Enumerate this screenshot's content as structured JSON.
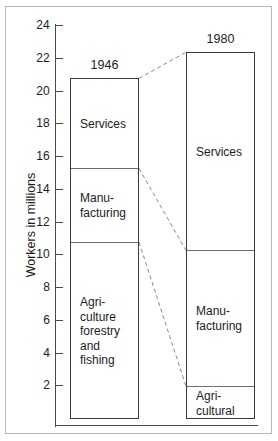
{
  "chart_data": {
    "type": "bar",
    "subtype": "stacked-column-comparison",
    "title": "",
    "xlabel": "",
    "ylabel": "Workers in millions",
    "ylim": [
      0,
      25
    ],
    "yticks": [
      2,
      4,
      6,
      8,
      10,
      12,
      14,
      16,
      18,
      20,
      22,
      24
    ],
    "grid": false,
    "legend": "none (segments labelled in place)",
    "units": "millions of workers",
    "categories": [
      "1946",
      "1980"
    ],
    "series": [
      {
        "name": "Agriculture forestry and fishing",
        "values": [
          10.8,
          2.0
        ]
      },
      {
        "name": "Manufacturing",
        "values": [
          4.5,
          8.3
        ]
      },
      {
        "name": "Services",
        "values": [
          5.5,
          12.1
        ]
      }
    ],
    "totals": [
      20.8,
      22.4
    ],
    "annotations": [
      "Dashed connector lines join the matching segment boundaries of the 1946 and 1980 columns."
    ]
  },
  "axis": {
    "title": "Workers in millions",
    "ticks": [
      {
        "value": 24,
        "label": "24"
      },
      {
        "value": 22,
        "label": "22"
      },
      {
        "value": 20,
        "label": "20"
      },
      {
        "value": 18,
        "label": "18"
      },
      {
        "value": 16,
        "label": "16"
      },
      {
        "value": 14,
        "label": "14"
      },
      {
        "value": 12,
        "label": "12"
      },
      {
        "value": 10,
        "label": "10"
      },
      {
        "value": 8,
        "label": "8"
      },
      {
        "value": 6,
        "label": "6"
      },
      {
        "value": 4,
        "label": "4"
      },
      {
        "value": 2,
        "label": "2"
      }
    ]
  },
  "bars": [
    {
      "key": "bar-1946",
      "title": "1946",
      "total": 20.8,
      "segments": [
        {
          "key": "services",
          "label": "Services",
          "bottom": 15.3,
          "top": 20.8,
          "value": 5.5
        },
        {
          "key": "manufacturing",
          "label": "Manu-\nfacturing",
          "bottom": 10.8,
          "top": 15.3,
          "value": 4.5
        },
        {
          "key": "agriculture",
          "label": "Agri-\nculture\nforestry\nand\nfishing",
          "bottom": 0,
          "top": 10.8,
          "value": 10.8
        }
      ]
    },
    {
      "key": "bar-1980",
      "title": "1980",
      "total": 22.4,
      "segments": [
        {
          "key": "services",
          "label": "Services",
          "bottom": 10.3,
          "top": 22.4,
          "value": 12.1
        },
        {
          "key": "manufacturing",
          "label": "Manu-\nfacturing",
          "bottom": 2.0,
          "top": 10.3,
          "value": 8.3
        },
        {
          "key": "agricultural",
          "label": "Agri-\ncultural",
          "bottom": 0,
          "top": 2.0,
          "value": 2.0
        }
      ]
    }
  ],
  "colors": {
    "background": "#ffffff",
    "axis": "#4a4a4a",
    "bar_outline": "#3a3a3a",
    "segment_rule": "#6e6e6e",
    "connector": "#8a8a8a",
    "frame": "#b9b9b9",
    "text": "#1c1c1c"
  }
}
